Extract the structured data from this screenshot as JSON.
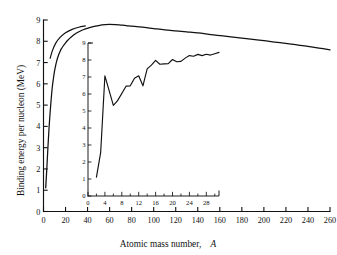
{
  "chart_data": {
    "type": "line",
    "title": "",
    "xlabel": "Atomic mass number,  A",
    "xlabel_plain": "Atomic mass number,",
    "xlabel_symbol": "A",
    "ylabel": "Binding energy per nucleon (MeV)",
    "xlim": [
      0,
      260
    ],
    "ylim": [
      0,
      9
    ],
    "grid": false,
    "legend": null,
    "xticks": [
      0,
      20,
      40,
      60,
      80,
      100,
      120,
      140,
      160,
      180,
      200,
      220,
      240,
      260
    ],
    "yticks": [
      0,
      1,
      2,
      3,
      4,
      5,
      6,
      7,
      8,
      9
    ],
    "series": [
      {
        "name": "Binding energy per nucleon (smoothed)",
        "x": [
          2,
          3,
          4,
          5,
          6,
          7,
          8,
          9,
          10,
          11,
          12,
          13,
          14,
          15,
          16,
          18,
          20,
          22,
          24,
          26,
          28,
          30,
          33,
          36,
          40,
          45,
          50,
          56,
          60,
          65,
          70,
          75,
          80,
          85,
          90,
          100,
          110,
          120,
          130,
          140,
          150,
          160,
          170,
          180,
          190,
          200,
          210,
          220,
          230,
          240,
          250,
          260
        ],
        "y": [
          1.11,
          2.01,
          3.0,
          3.9,
          4.65,
          5.3,
          5.85,
          6.25,
          6.6,
          6.85,
          7.08,
          7.25,
          7.4,
          7.52,
          7.63,
          7.79,
          7.93,
          8.05,
          8.15,
          8.24,
          8.32,
          8.39,
          8.47,
          8.54,
          8.61,
          8.69,
          8.74,
          8.78,
          8.79,
          8.78,
          8.76,
          8.74,
          8.71,
          8.69,
          8.66,
          8.6,
          8.54,
          8.49,
          8.44,
          8.39,
          8.33,
          8.27,
          8.21,
          8.15,
          8.09,
          8.03,
          7.96,
          7.9,
          7.83,
          7.76,
          7.68,
          7.6
        ]
      }
    ],
    "leader_line": {
      "name": "inset-leader-line",
      "x": [
        6,
        8,
        11,
        15,
        20,
        26,
        32,
        38
      ],
      "y": [
        7.2,
        7.55,
        7.9,
        8.18,
        8.4,
        8.56,
        8.66,
        8.72
      ]
    },
    "inset": {
      "type": "line",
      "xlim": [
        0,
        31
      ],
      "ylim": [
        0,
        9
      ],
      "xticks": [
        0,
        4,
        8,
        12,
        16,
        20,
        24,
        28
      ],
      "xminorticks": [
        2,
        6,
        10,
        14,
        18,
        22,
        26,
        30
      ],
      "yticks": [
        0,
        1,
        2,
        3,
        4,
        5,
        6,
        7,
        8,
        9
      ],
      "series": [
        {
          "name": "Binding energy per nucleon (light nuclei)",
          "x": [
            2,
            3,
            4,
            6,
            7,
            9,
            10,
            11,
            12,
            13,
            14,
            15,
            16,
            17,
            18,
            19,
            20,
            21,
            22,
            23,
            24,
            25,
            26,
            27,
            28,
            29,
            30,
            31
          ],
          "y": [
            1.11,
            2.57,
            7.07,
            5.33,
            5.61,
            6.46,
            6.48,
            6.93,
            7.07,
            6.48,
            7.48,
            7.7,
            7.98,
            7.75,
            7.77,
            7.79,
            8.03,
            7.9,
            7.92,
            8.11,
            8.26,
            8.22,
            8.33,
            8.26,
            8.34,
            8.29,
            8.37,
            8.45
          ]
        }
      ]
    }
  }
}
